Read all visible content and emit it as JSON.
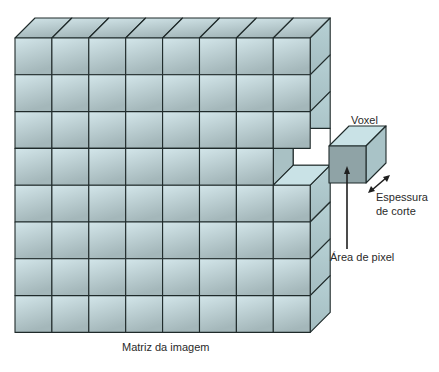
{
  "diagram": {
    "title": "Matriz da imagem",
    "matrix": {
      "rows": 8,
      "cols": 8,
      "missing_cell": {
        "row": 4,
        "col": 8
      }
    },
    "labels": {
      "matrix": "Matriz da imagem",
      "voxel": "Voxel",
      "thickness_line1": "Espessura",
      "thickness_line2": "de corte",
      "pixel_area": "Área de pixel"
    },
    "colors": {
      "front_light": "#cfe2e6",
      "front_dark": "#9fb2b6",
      "top": "#c9e2e6",
      "side": "#a9c3c7",
      "voxel_front": "#8fa3a6",
      "line": "#1f2a2a"
    }
  }
}
